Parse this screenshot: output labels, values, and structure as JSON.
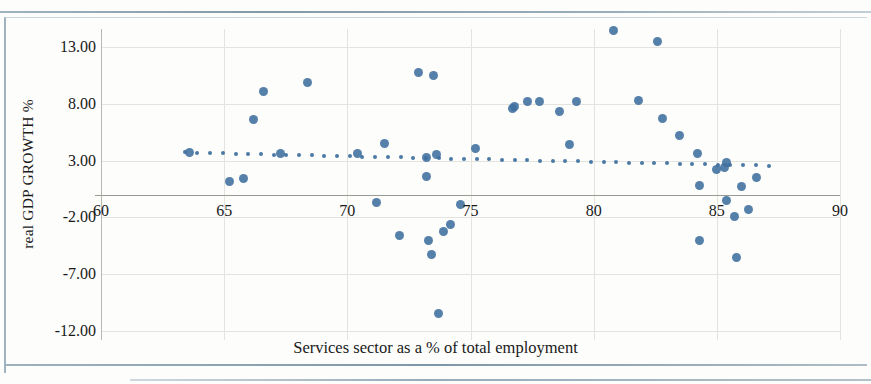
{
  "chart_data": {
    "type": "scatter",
    "title": "",
    "xlabel": "Services sector as a % of total employment",
    "ylabel": "real GDP GROWTH %",
    "xlim": [
      60,
      90
    ],
    "ylim": [
      -12,
      13
    ],
    "xticks": [
      "60",
      "65",
      "70",
      "75",
      "80",
      "85",
      "90"
    ],
    "xtick_values": [
      60,
      65,
      70,
      75,
      80,
      85,
      90
    ],
    "yticks": [
      "13.00",
      "8.00",
      "3.00",
      "-2.00",
      "-7.00",
      "-12.00"
    ],
    "ytick_values": [
      13,
      8,
      3,
      -2,
      -7,
      -12
    ],
    "grid": true,
    "legend": "none",
    "marker_color": "#3d6e9e",
    "trendline_color": "#3d6e9e",
    "trendline_style": "dotted",
    "series": [
      {
        "name": "Countries",
        "points": [
          [
            63.6,
            3.7
          ],
          [
            65.2,
            1.2
          ],
          [
            65.8,
            1.4
          ],
          [
            66.2,
            6.6
          ],
          [
            66.6,
            9.1
          ],
          [
            67.3,
            3.6
          ],
          [
            68.4,
            9.9
          ],
          [
            70.4,
            3.6
          ],
          [
            71.2,
            -0.7
          ],
          [
            71.5,
            4.5
          ],
          [
            72.1,
            -3.6
          ],
          [
            72.9,
            10.8
          ],
          [
            73.2,
            3.3
          ],
          [
            73.2,
            1.6
          ],
          [
            73.3,
            -4.0
          ],
          [
            73.4,
            -5.3
          ],
          [
            73.5,
            10.5
          ],
          [
            73.6,
            3.5
          ],
          [
            73.7,
            -10.5
          ],
          [
            73.9,
            -3.2
          ],
          [
            74.2,
            -2.6
          ],
          [
            74.6,
            -0.9
          ],
          [
            75.2,
            4.1
          ],
          [
            76.7,
            7.6
          ],
          [
            76.8,
            7.8
          ],
          [
            77.3,
            8.2
          ],
          [
            77.8,
            8.2
          ],
          [
            78.6,
            7.3
          ],
          [
            79.0,
            4.4
          ],
          [
            79.3,
            8.2
          ],
          [
            80.8,
            14.5
          ],
          [
            81.8,
            8.3
          ],
          [
            82.6,
            13.5
          ],
          [
            82.8,
            6.7
          ],
          [
            83.5,
            5.2
          ],
          [
            84.2,
            3.6
          ],
          [
            84.3,
            0.8
          ],
          [
            84.3,
            -4.0
          ],
          [
            85.0,
            2.2
          ],
          [
            85.3,
            2.4
          ],
          [
            85.4,
            2.8
          ],
          [
            85.4,
            -0.5
          ],
          [
            85.7,
            -1.9
          ],
          [
            85.8,
            -5.5
          ],
          [
            86.0,
            0.7
          ],
          [
            86.3,
            -1.3
          ],
          [
            86.6,
            1.5
          ]
        ]
      }
    ],
    "trendline": {
      "name": "Linear trend",
      "x_start": 63.4,
      "y_start": 3.72,
      "x_end": 87.1,
      "y_end": 2.55
    }
  }
}
